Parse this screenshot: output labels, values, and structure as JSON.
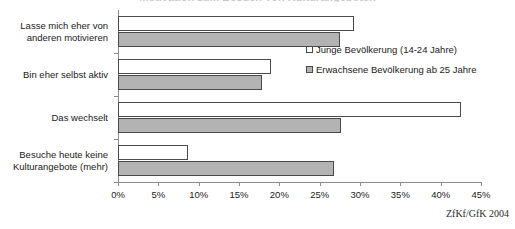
{
  "figure": {
    "title_remnant": "Motivation zum Besuch von Kulturangeboten",
    "source_note": "ZfKf/GfK 2004"
  },
  "legend": {
    "position": "inside-right-top",
    "items": [
      {
        "label": "Junge Bevölkerung (14-24 Jahre)",
        "swatch": "white-square-icon",
        "color": "#ffffff"
      },
      {
        "label": "Erwachsene Bevölkerung ab 25 Jahre",
        "swatch": "gray-square-icon",
        "color": "#b3b3b3"
      }
    ]
  },
  "chart_data": {
    "type": "bar",
    "orientation": "horizontal",
    "title": "",
    "xlabel": "",
    "ylabel": "",
    "xlim": [
      0,
      45
    ],
    "grid": false,
    "value_suffix": "%",
    "tick_labels": [
      "0%",
      "5%",
      "10%",
      "15%",
      "20%",
      "25%",
      "30%",
      "35%",
      "40%",
      "45%"
    ],
    "tick_values": [
      0,
      5,
      10,
      15,
      20,
      25,
      30,
      35,
      40,
      45
    ],
    "categories": [
      "Lasse mich eher von anderen motivieren",
      "Bin eher selbst aktiv",
      "Das wechselt",
      "Besuche heute keine Kulturangebote (mehr)"
    ],
    "category_lines": [
      [
        "Lasse mich eher von",
        "anderen motivieren"
      ],
      [
        "Bin eher selbst aktiv"
      ],
      [
        "Das wechselt"
      ],
      [
        "Besuche heute keine",
        "Kulturangebote (mehr)"
      ]
    ],
    "series": [
      {
        "name": "Junge Bevölkerung (14-24 Jahre)",
        "color": "#ffffff",
        "values": [
          29.3,
          19.0,
          42.5,
          8.7
        ]
      },
      {
        "name": "Erwachsene Bevölkerung ab 25 Jahre",
        "color": "#b3b3b3",
        "values": [
          27.5,
          17.8,
          27.6,
          26.8
        ]
      }
    ]
  }
}
